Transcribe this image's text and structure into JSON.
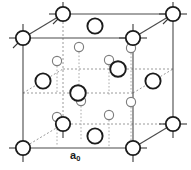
{
  "figure": {
    "name": "diamond-cubic-unit-cell",
    "caption_label": "a",
    "caption_subscript": "0",
    "background_color": "#ffffff"
  },
  "colors": {
    "solid_edge": "#4a4a4a",
    "dashed_edge": "#9a9a9a",
    "dotted_bond": "#aaaaaa",
    "atom_outline_dark": "#1b1b1b",
    "atom_outline_light": "#7d7d7d",
    "atom_fill": "#ffffff",
    "label_color": "#1b1b1b"
  },
  "geometry": {
    "view_box": "0 0 191 170",
    "front_face": {
      "top_left": [
        23,
        38
      ],
      "top_right": [
        133,
        38
      ],
      "bottom_right": [
        133,
        148
      ],
      "bottom_left": [
        23,
        148
      ]
    },
    "back_face": {
      "top_left": [
        63,
        14
      ],
      "top_right": [
        173,
        14
      ],
      "bottom_right": [
        173,
        124
      ],
      "bottom_left": [
        63,
        124
      ]
    },
    "depth_offset": [
      40,
      -24
    ]
  },
  "atoms": {
    "corner": [
      {
        "id": "corner-front-top-left",
        "cx": 23,
        "cy": 38,
        "r": 7.2
      },
      {
        "id": "corner-front-top-right",
        "cx": 133,
        "cy": 38,
        "r": 7.2
      },
      {
        "id": "corner-front-bottom-left",
        "cx": 23,
        "cy": 148,
        "r": 7.2
      },
      {
        "id": "corner-front-bottom-right",
        "cx": 133,
        "cy": 148,
        "r": 7.2
      },
      {
        "id": "corner-back-top-left",
        "cx": 63,
        "cy": 14,
        "r": 7.2
      },
      {
        "id": "corner-back-top-right",
        "cx": 173,
        "cy": 14,
        "r": 7.2
      },
      {
        "id": "corner-back-bottom-left",
        "cx": 63,
        "cy": 124,
        "r": 7.2
      },
      {
        "id": "corner-back-bottom-right",
        "cx": 173,
        "cy": 124,
        "r": 7.2
      }
    ],
    "face_center": [
      {
        "id": "face-center-top",
        "cx": 95,
        "cy": 26,
        "r": 7.6
      },
      {
        "id": "face-center-bottom",
        "cx": 95,
        "cy": 136,
        "r": 7.6
      },
      {
        "id": "face-center-left",
        "cx": 43,
        "cy": 81,
        "r": 7.6
      },
      {
        "id": "face-center-right",
        "cx": 153,
        "cy": 81,
        "r": 7.6
      },
      {
        "id": "face-center-front",
        "cx": 78,
        "cy": 93,
        "r": 7.8
      },
      {
        "id": "face-center-back",
        "cx": 118,
        "cy": 69,
        "r": 7.8
      }
    ],
    "interior_large": [
      {
        "id": "interior-large-a",
        "cx": 78,
        "cy": 93,
        "r": 7.8
      },
      {
        "id": "interior-large-b",
        "cx": 118,
        "cy": 69,
        "r": 7.8
      },
      {
        "id": "interior-large-c",
        "cx": 63,
        "cy": 124,
        "r": 7.2
      },
      {
        "id": "interior-large-d",
        "cx": 133,
        "cy": 38,
        "r": 7.2
      }
    ],
    "interior_small": [
      {
        "id": "interior-small-1",
        "cx": 79,
        "cy": 47,
        "r": 4.6
      },
      {
        "id": "interior-small-2",
        "cx": 57,
        "cy": 61,
        "r": 4.6
      },
      {
        "id": "interior-small-3",
        "cx": 109,
        "cy": 60,
        "r": 4.6
      },
      {
        "id": "interior-small-4",
        "cx": 130,
        "cy": 48,
        "r": 4.6
      },
      {
        "id": "interior-small-5",
        "cx": 81,
        "cy": 101,
        "r": 4.6
      },
      {
        "id": "interior-small-6",
        "cx": 57,
        "cy": 117,
        "r": 4.6
      },
      {
        "id": "interior-small-7",
        "cx": 109,
        "cy": 115,
        "r": 4.6
      },
      {
        "id": "interior-small-8",
        "cx": 131,
        "cy": 102,
        "r": 4.6
      }
    ]
  },
  "bonds_dotted": [
    {
      "id": "bond-1",
      "x1": 79,
      "y1": 52,
      "x2": 79,
      "y2": 85
    },
    {
      "id": "bond-2",
      "x1": 57,
      "y1": 66,
      "x2": 57,
      "y2": 92
    },
    {
      "id": "bond-3",
      "x1": 109,
      "y1": 64,
      "x2": 109,
      "y2": 96
    },
    {
      "id": "bond-4",
      "x1": 131,
      "y1": 52,
      "x2": 131,
      "y2": 92
    },
    {
      "id": "bond-5",
      "x1": 81,
      "y1": 106,
      "x2": 81,
      "y2": 140
    },
    {
      "id": "bond-6",
      "x1": 57,
      "y1": 121,
      "x2": 57,
      "y2": 146
    },
    {
      "id": "bond-7",
      "x1": 109,
      "y1": 119,
      "x2": 109,
      "y2": 148
    },
    {
      "id": "bond-8",
      "x1": 131,
      "y1": 107,
      "x2": 131,
      "y2": 141
    }
  ]
}
